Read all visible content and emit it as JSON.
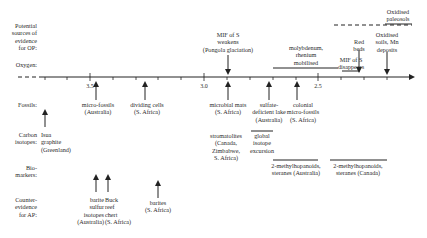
{
  "row_labels": {
    "op_sources": "Potential\nsources of\nevidence\nfor OP:",
    "oxygen": "Oxygen:",
    "fossils": "Fossils:",
    "carbon": "Carbon\nisotopes:",
    "biomarkers": "Bio-\nmarkers:",
    "counter": "Counter-\nevidence\nfor AP:"
  },
  "axis": {
    "ticks": [
      "3.5",
      "3.0",
      "2.5"
    ],
    "unit_hint": "Ga (billion years ago)"
  },
  "events": {
    "mif_weakens": "MIF of S\nweakens\n(Pongola glaciation)",
    "molybdenum": "molybdenum,\nrhenium\nmobilised",
    "mif_disappears": "MIF of S\ndisappears",
    "red_beds": "Red\nbeds",
    "oxidised_soils": "Oxidised\nsoils, Mn\ndeposits",
    "oxidised_paleosols": "Oxidised\npaleosols"
  },
  "fossils": {
    "microfossils": "micro-fossils\n(Australia)",
    "dividing_cells": "dividing cells\n(S. Africa)",
    "microbial_mats": "microbial mats\n(S. Africa)",
    "sulfate_lake": "sulfate-\ndeficient lake\n(Australia)",
    "colonial": "colonial\nmicro-fossils\n(S. Africa)",
    "stromatolites": "stromatolites\n(Canada,\nZimbabwe,\nS. Africa)"
  },
  "carbon": {
    "isua": "Isua\ngraphite\n(Greenland)",
    "global": "global\nisotope\nexcursion"
  },
  "biomarkers": {
    "australia": "2-methylhopanoids,\nsteranes (Australia)",
    "canada": "2-methylhopanoids,\nsteranes (Canada)"
  },
  "counter": {
    "barite_sulfur": "barite\nsulfur\nisotopes\n(Australia)",
    "buck_reef": "Buck\nreef\nchert\n(S. Africa)",
    "barites": "barites\n(S. Africa)"
  }
}
